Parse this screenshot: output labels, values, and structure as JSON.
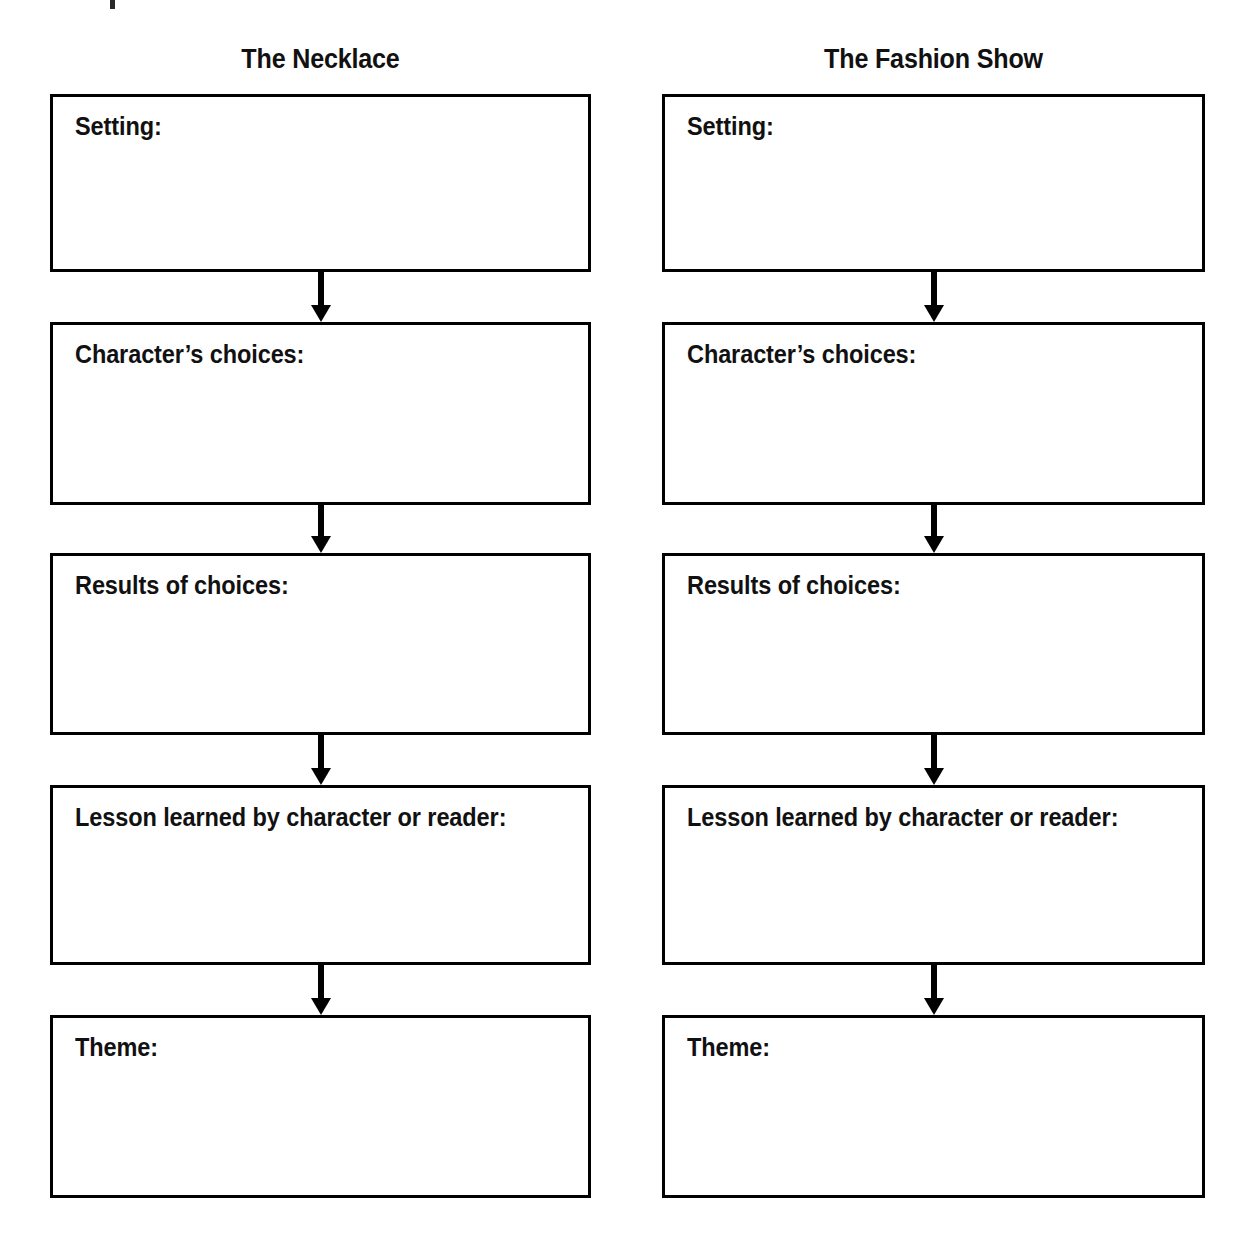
{
  "worksheet": {
    "type": "story-comparison-flowchart",
    "ink_color": "#000000",
    "page_background": "#ffffff",
    "columns": [
      {
        "title": "The Necklace",
        "boxes": [
          {
            "label": "Setting:",
            "value": ""
          },
          {
            "label": "Character’s choices:",
            "value": ""
          },
          {
            "label": "Results of choices:",
            "value": ""
          },
          {
            "label": "Lesson learned by character or reader:",
            "value": ""
          },
          {
            "label": "Theme:",
            "value": ""
          }
        ],
        "connectors": [
          "down-arrow-icon",
          "down-arrow-icon",
          "down-arrow-icon",
          "down-arrow-icon"
        ]
      },
      {
        "title": "The Fashion Show",
        "boxes": [
          {
            "label": "Setting:",
            "value": ""
          },
          {
            "label": "Character’s choices:",
            "value": ""
          },
          {
            "label": "Results of choices:",
            "value": ""
          },
          {
            "label": "Lesson learned by character or reader:",
            "value": ""
          },
          {
            "label": "Theme:",
            "value": ""
          }
        ],
        "connectors": [
          "down-arrow-icon",
          "down-arrow-icon",
          "down-arrow-icon",
          "down-arrow-icon"
        ]
      }
    ]
  }
}
